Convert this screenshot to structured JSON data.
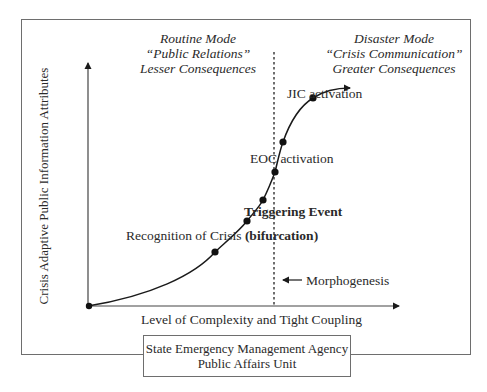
{
  "diagram": {
    "routine_mode": {
      "line1": "Routine Mode",
      "line2": "“Public Relations”",
      "line3": "Lesser Consequences"
    },
    "disaster_mode": {
      "line1": "Disaster Mode",
      "line2": "“Crisis Communication”",
      "line3": "Greater Consequences"
    },
    "y_axis_label": "Crisis Adaptive Public Information Attributes",
    "x_axis_label": "Level of Complexity and Tight Coupling",
    "annotations": {
      "jic": "JIC activation",
      "eoc": "EOC activation",
      "trigger": "Triggering Event",
      "recognition_prefix": "Recognition of Crisis ",
      "recognition_bold": "(bifurcation)",
      "morphogenesis": "Morphogenesis"
    },
    "organization": {
      "line1": "State Emergency Management Agency",
      "line2": "Public Affairs Unit"
    },
    "colors": {
      "ink": "#1a1a1a",
      "frame": "#6e6e6e",
      "background": "#ffffff"
    }
  }
}
